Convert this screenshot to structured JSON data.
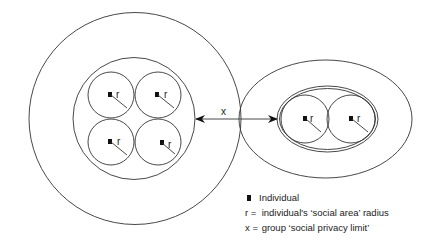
{
  "diagram": {
    "radius_label": "r",
    "distance_label": "x",
    "left_group": {
      "individuals": [
        {
          "cx": 111,
          "cy": 95
        },
        {
          "cx": 158,
          "cy": 95
        },
        {
          "cx": 111,
          "cy": 142
        },
        {
          "cx": 158,
          "cy": 142
        }
      ]
    },
    "right_group": {
      "individuals": [
        {
          "cx": 305,
          "cy": 119
        },
        {
          "cx": 351,
          "cy": 119
        }
      ]
    }
  },
  "legend": {
    "items": [
      {
        "symbol": "square",
        "text": "Individual"
      },
      {
        "symbol": "r =",
        "text": "individual's ‘social area’ radius"
      },
      {
        "symbol": "x =",
        "text": "group ‘social privacy limit’"
      }
    ]
  },
  "colors": {
    "stroke": "#333333",
    "fill": "#111111",
    "background": "#ffffff"
  }
}
